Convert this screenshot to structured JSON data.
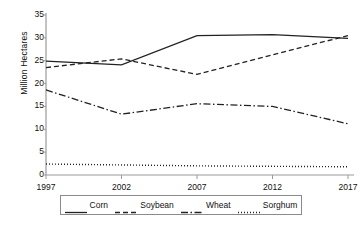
{
  "chart_data": {
    "type": "line",
    "title": "",
    "xlabel": "",
    "ylabel": "Million Hectares",
    "x": [
      1997,
      2002,
      2007,
      2012,
      2017
    ],
    "categories": [
      "1997",
      "2002",
      "2007",
      "2012",
      "2017"
    ],
    "ylim": [
      0,
      35
    ],
    "yticks": [
      0,
      5,
      10,
      15,
      20,
      25,
      30,
      35
    ],
    "ytick_labels": [
      "0",
      "5",
      "10",
      "15",
      "20",
      "25",
      "30",
      "35"
    ],
    "grid": false,
    "legend_position": "bottom",
    "series": [
      {
        "name": "Corn",
        "style": "solid",
        "color": "#222222",
        "values": [
          24.9,
          24.1,
          30.5,
          30.7,
          29.9
        ]
      },
      {
        "name": "Soybean",
        "style": "dashed",
        "color": "#222222",
        "values": [
          23.5,
          25.4,
          22.0,
          26.3,
          30.5
        ]
      },
      {
        "name": "Wheat",
        "style": "dashdot",
        "color": "#222222",
        "values": [
          18.6,
          13.3,
          15.6,
          15.0,
          11.2
        ]
      },
      {
        "name": "Sorghum",
        "style": "dotted",
        "color": "#222222",
        "values": [
          2.4,
          2.2,
          2.0,
          1.9,
          1.8
        ]
      }
    ]
  },
  "axes": {
    "y_title": "Million Hectares",
    "y_tick_labels": [
      "35",
      "30",
      "25",
      "20",
      "15",
      "10",
      "5",
      "0"
    ],
    "x_tick_labels": [
      "1997",
      "2002",
      "2007",
      "2012",
      "2017"
    ]
  },
  "legend": {
    "entries": [
      {
        "label": "Corn",
        "style": "solid"
      },
      {
        "label": "Soybean",
        "style": "dashed"
      },
      {
        "label": "Wheat",
        "style": "dashdot"
      },
      {
        "label": "Sorghum",
        "style": "dotted"
      }
    ]
  },
  "colors": {
    "axis": "#9a9a9a",
    "line": "#222222",
    "text": "#111111",
    "legend_border": "#8a8a8a"
  }
}
